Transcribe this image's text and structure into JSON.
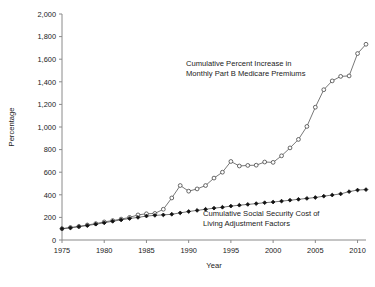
{
  "chart_data": {
    "type": "line",
    "title": "",
    "xlabel": "Year",
    "ylabel": "Percentage",
    "xlim": [
      1975,
      2011
    ],
    "ylim": [
      0,
      2000
    ],
    "grid": false,
    "legend_position": "inline-annotations",
    "xticks": [
      1975,
      1980,
      1985,
      1990,
      1995,
      2000,
      2005,
      2010
    ],
    "xtick_labels": [
      "1975",
      "1980",
      "1985",
      "1990",
      "1995",
      "2000",
      "2005",
      "2010"
    ],
    "yticks": [
      0,
      200,
      400,
      600,
      800,
      1000,
      1200,
      1400,
      1600,
      1800,
      2000
    ],
    "ytick_labels": [
      "0",
      "200",
      "400",
      "600",
      "800",
      "1,000",
      "1,200",
      "1,400",
      "1,600",
      "1,800",
      "2,000"
    ],
    "x": [
      1975,
      1976,
      1977,
      1978,
      1979,
      1980,
      1981,
      1982,
      1983,
      1984,
      1985,
      1986,
      1987,
      1988,
      1989,
      1990,
      1991,
      1992,
      1993,
      1994,
      1995,
      1996,
      1997,
      1998,
      1999,
      2000,
      2001,
      2002,
      2003,
      2004,
      2005,
      2006,
      2007,
      2008,
      2009,
      2010,
      2011
    ],
    "series": [
      {
        "name": "Cumulative Percent Increase in Monthly Part B Medicare Premiums",
        "marker": "open-circle",
        "values": [
          100,
          110,
          120,
          133,
          145,
          160,
          172,
          185,
          200,
          222,
          232,
          235,
          272,
          372,
          482,
          432,
          452,
          482,
          548,
          600,
          695,
          655,
          660,
          662,
          690,
          687,
          745,
          815,
          890,
          1005,
          1175,
          1330,
          1408,
          1448,
          1452,
          1650,
          1732
        ]
      },
      {
        "name": "Cumulative Social Security Cost of Living Adjustment Factors",
        "marker": "solid-diamond",
        "values": [
          100,
          108,
          118,
          128,
          140,
          152,
          166,
          178,
          190,
          200,
          212,
          218,
          222,
          228,
          240,
          252,
          262,
          272,
          282,
          290,
          300,
          308,
          315,
          322,
          330,
          336,
          344,
          352,
          360,
          368,
          376,
          388,
          398,
          408,
          428,
          442,
          446
        ]
      }
    ],
    "annotations": [
      {
        "name": "medicare-annotation",
        "lines": [
          "Cumulative Percent Increase in",
          "Monthly Part B Medicare Premiums"
        ],
        "x_px": 186,
        "y_px": 66
      },
      {
        "name": "cola-annotation",
        "lines": [
          "Cumulative Social Security Cost of",
          "Living Adjustment Factors"
        ],
        "x_px": 203,
        "y_px": 216
      }
    ]
  }
}
